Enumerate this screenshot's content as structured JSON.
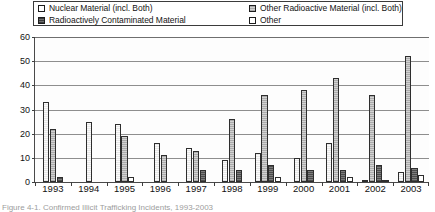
{
  "legend": {
    "entries": [
      {
        "label": "Nuclear Material (incl. Both)",
        "swatch": "legend-swatch-white",
        "series_key": "nuclear"
      },
      {
        "label": "Radioactively Contaminated Material",
        "swatch": "legend-swatch-dark",
        "series_key": "contaminated"
      },
      {
        "label": "Other Radioactive Material (incl. Both)",
        "swatch": "legend-swatch-gray",
        "series_key": "other_radioactive"
      },
      {
        "label": "Other",
        "swatch": "legend-swatch-white",
        "series_key": "other"
      }
    ]
  },
  "axes": {
    "y_ticks": [
      "0",
      "10",
      "20",
      "30",
      "40",
      "50",
      "60"
    ],
    "x_ticks": [
      "1993",
      "1994",
      "1995",
      "1996",
      "1997",
      "1998",
      "1999",
      "2000",
      "2001",
      "2002",
      "2003"
    ]
  },
  "caption": {
    "text": "Figure 4-1. Confirmed Illicit Trafficking Incidents, 1993-2003"
  },
  "chart_data": {
    "type": "bar",
    "title": "",
    "subtitle": "",
    "xlabel": "",
    "ylabel": "",
    "ylim": [
      0,
      60
    ],
    "ytick_step": 10,
    "grid": true,
    "legend_position": "top",
    "categories": [
      "1993",
      "1994",
      "1995",
      "1996",
      "1997",
      "1998",
      "1999",
      "2000",
      "2001",
      "2002",
      "2003"
    ],
    "series": [
      {
        "name": "Nuclear Material (incl. Both)",
        "key": "nuclear",
        "style": "white-outline",
        "values": [
          33,
          25,
          24,
          16,
          14,
          9,
          12,
          10,
          16,
          1,
          4
        ]
      },
      {
        "name": "Other Radioactive Material (incl. Both)",
        "key": "other_radioactive",
        "style": "light-gray",
        "values": [
          22,
          0,
          19,
          11,
          13,
          26,
          36,
          38,
          43,
          36,
          52
        ]
      },
      {
        "name": "Radioactively Contaminated Material",
        "key": "contaminated",
        "style": "dark-gray",
        "values": [
          2,
          0,
          0,
          0,
          5,
          5,
          7,
          5,
          5,
          7,
          6
        ]
      },
      {
        "name": "Other",
        "key": "other",
        "style": "white",
        "values": [
          0,
          0,
          2,
          0,
          0,
          0,
          2,
          0,
          2,
          1,
          3
        ]
      }
    ]
  }
}
